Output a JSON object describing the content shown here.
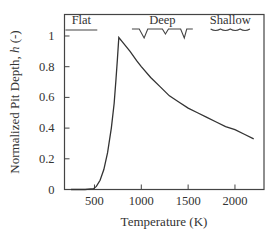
{
  "chart_data": {
    "type": "line",
    "title": "",
    "xlabel": "Temperature (K)",
    "ylabel_main": "Normalized Pit Depth, ",
    "ylabel_var": "h",
    "ylabel_unit": " (-)",
    "xlim": [
      180,
      2310
    ],
    "ylim": [
      0,
      1.14
    ],
    "grid": false,
    "legend": "none",
    "x_ticks": [
      500,
      1000,
      1500,
      2000
    ],
    "x_tick_labels": [
      "500",
      "1000",
      "1500",
      "2000"
    ],
    "y_ticks": [
      0,
      0.2,
      0.4,
      0.6,
      0.8,
      1
    ],
    "y_tick_labels": [
      "0",
      "0.2",
      "0.4",
      "0.6",
      "0.8",
      "1"
    ],
    "series": [
      {
        "name": "h(T)",
        "color": "#333333",
        "x": [
          250,
          400,
          490,
          520,
          560,
          600,
          640,
          680,
          710,
          730,
          745,
          760,
          800,
          880,
          950,
          1000,
          1100,
          1200,
          1300,
          1400,
          1500,
          1600,
          1700,
          1800,
          1900,
          2000,
          2100,
          2200
        ],
        "y": [
          0.0,
          0.0,
          0.005,
          0.02,
          0.06,
          0.13,
          0.24,
          0.4,
          0.56,
          0.72,
          0.85,
          0.99,
          0.96,
          0.9,
          0.84,
          0.8,
          0.73,
          0.67,
          0.61,
          0.57,
          0.53,
          0.5,
          0.47,
          0.44,
          0.41,
          0.39,
          0.36,
          0.33
        ]
      }
    ],
    "annotations": [
      {
        "label": "Flat",
        "x_range": [
          190,
          530
        ],
        "glyph": "flat-line"
      },
      {
        "label": "Deep",
        "x_range": [
          900,
          1550
        ],
        "glyph": "deep-pits"
      },
      {
        "label": "Shallow",
        "x_range": [
          1740,
          2160
        ],
        "glyph": "shallow-wave"
      }
    ]
  }
}
